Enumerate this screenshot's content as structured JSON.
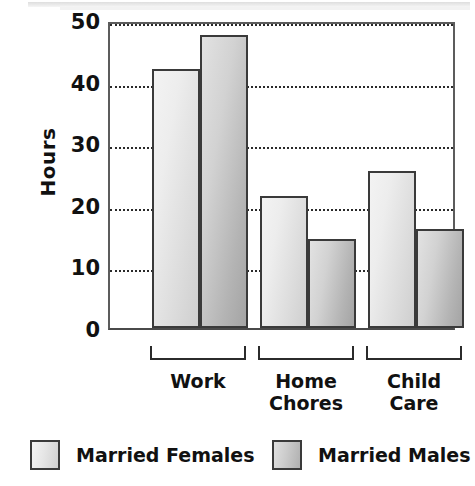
{
  "chart_data": {
    "type": "bar",
    "title": "",
    "xlabel": "",
    "ylabel": "Hours",
    "ylim": [
      0,
      50
    ],
    "yticks": [
      0,
      10,
      20,
      30,
      40,
      50
    ],
    "ytick_labels": [
      "0",
      "10",
      "20",
      "30",
      "40",
      "50"
    ],
    "grid": true,
    "legend_position": "bottom",
    "categories": [
      "Work",
      "Home\nChores",
      "Child\nCare"
    ],
    "series": [
      {
        "name": "Married Females",
        "values": [
          42,
          21.5,
          25.5
        ],
        "color": "#e6e6e6"
      },
      {
        "name": "Married Males",
        "values": [
          47.5,
          14.5,
          16
        ],
        "color": "#c0c0c0"
      }
    ]
  },
  "axis": {
    "y_title": "Hours"
  },
  "legend": {
    "items": [
      {
        "label": "Married Females",
        "swatch": "light-gray-swatch"
      },
      {
        "label": "Married Males",
        "swatch": "dark-gray-swatch"
      }
    ]
  }
}
